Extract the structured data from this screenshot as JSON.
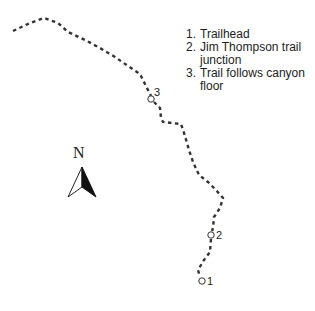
{
  "map": {
    "trail_color": "#333333",
    "waypoints": [
      {
        "id": "1",
        "label": "1"
      },
      {
        "id": "2",
        "label": "2"
      },
      {
        "id": "3",
        "label": "3"
      }
    ],
    "north_arrow": {
      "label": "N"
    }
  },
  "legend": {
    "items": [
      {
        "num": "1.",
        "text": "Trailhead"
      },
      {
        "num": "2.",
        "text": "Jim Thompson trail junction"
      },
      {
        "num": "3.",
        "text": "Trail follows canyon floor"
      }
    ]
  }
}
